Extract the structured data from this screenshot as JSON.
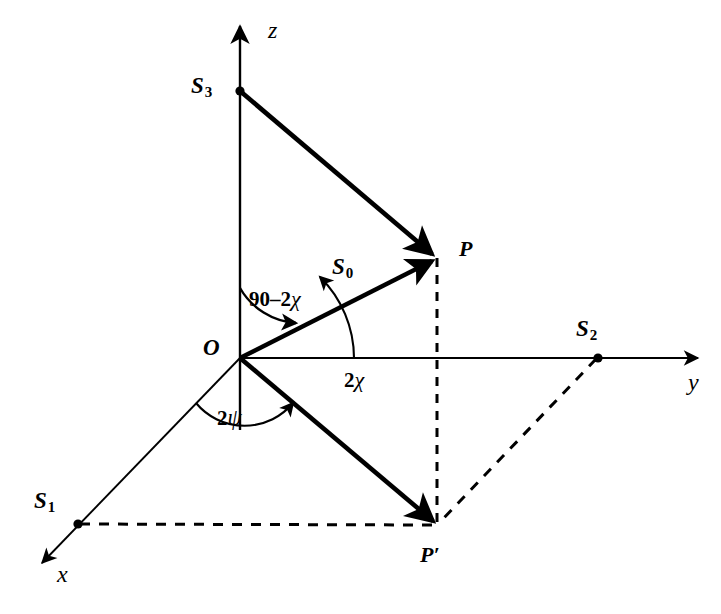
{
  "figure": {
    "background_color": "#ffffff",
    "stroke_color": "#000000",
    "axes": [
      {
        "name": "z",
        "label": "z",
        "label_x": 270,
        "label_y": 22,
        "from": [
          240,
          430
        ],
        "to": [
          240,
          22
        ]
      },
      {
        "name": "y",
        "label": "y",
        "label_x": 690,
        "label_y": 380,
        "from": [
          240,
          358
        ],
        "to": [
          702,
          358
        ]
      },
      {
        "name": "x",
        "label": "x",
        "label_x": 58,
        "label_y": 570,
        "from": [
          240,
          358
        ],
        "to": [
          36,
          570
        ]
      }
    ],
    "points": [
      {
        "name": "S3",
        "label": "S",
        "sub": "3",
        "x": 240,
        "y": 91,
        "label_x": 192,
        "label_y": 74,
        "dot": true
      },
      {
        "name": "S2",
        "label": "S",
        "sub": "2",
        "x": 598,
        "y": 358,
        "label_x": 578,
        "label_y": 317,
        "dot": true
      },
      {
        "name": "S1",
        "label": "S",
        "sub": "1",
        "x": 78,
        "y": 524,
        "label_x": 34,
        "label_y": 490,
        "dot": true
      },
      {
        "name": "P",
        "label": "P",
        "sub": "",
        "x": 437,
        "y": 258,
        "label_x": 460,
        "label_y": 240,
        "dot": false
      },
      {
        "name": "P-prime",
        "label": "P′",
        "sub": "",
        "x": 437,
        "y": 525,
        "label_x": 421,
        "label_y": 545,
        "dot": false
      },
      {
        "name": "O",
        "label": "O",
        "sub": "",
        "x": 240,
        "y": 358,
        "label_x": 204,
        "label_y": 338,
        "dot": false
      }
    ],
    "vectors": [
      {
        "name": "S0-vector",
        "label": "S",
        "sub": "0",
        "from": [
          240,
          358
        ],
        "to": [
          437,
          258
        ],
        "label_x": 335,
        "label_y": 258
      },
      {
        "name": "S3-to-P",
        "label": "",
        "sub": "",
        "from": [
          240,
          91
        ],
        "to": [
          437,
          258
        ]
      },
      {
        "name": "O-to-Pprime",
        "label": "",
        "sub": "",
        "from": [
          240,
          358
        ],
        "to": [
          437,
          525
        ]
      }
    ],
    "dashed_lines": [
      {
        "name": "P-to-Pprime",
        "from": [
          437,
          258
        ],
        "to": [
          437,
          525
        ]
      },
      {
        "name": "S1-to-Pprime",
        "from": [
          78,
          524
        ],
        "to": [
          437,
          525
        ]
      },
      {
        "name": "S2-to-Pprime",
        "from": [
          598,
          358
        ],
        "to": [
          437,
          525
        ]
      }
    ],
    "angles": [
      {
        "name": "angle-90-minus-2chi",
        "text_bold": "90–2",
        "text_greek": "χ",
        "label_x": 251,
        "label_y": 289
      },
      {
        "name": "angle-2chi",
        "text_bold": "2",
        "text_greek": "χ",
        "label_x": 345,
        "label_y": 370
      },
      {
        "name": "angle-2psi",
        "text_bold": "2",
        "text_greek": "ψ",
        "label_x": 218,
        "label_y": 408
      }
    ]
  }
}
